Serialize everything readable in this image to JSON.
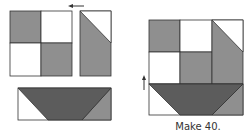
{
  "diagram": {
    "type": "quilt-block-assembly",
    "caption": "Make 40.",
    "colors": {
      "dark": "#5c5c5c",
      "medium": "#8f8f8f",
      "light": "#ffffff",
      "outline": "#333333"
    },
    "left_assembly": {
      "four_patch": {
        "cells": [
          "medium",
          "light",
          "light",
          "medium"
        ]
      },
      "triangle_unit": {
        "top_triangle": "light",
        "bottom_part": "medium"
      },
      "bottom_strip": {
        "left": "light",
        "center_trapezoid": "dark",
        "right": "medium"
      },
      "arrows": [
        "left-arrow"
      ]
    },
    "right_assembly": {
      "description": "four-patch + triangle unit joined, with trapezoid strip sewn below",
      "arrows": [
        "up-arrow"
      ]
    }
  }
}
